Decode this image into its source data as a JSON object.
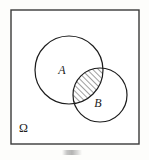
{
  "figure": {
    "kind": "venn-diagram",
    "title_caption": "",
    "background_color": "#fdfdfb",
    "stroke_color": "#1c1c1c"
  },
  "sample_space": {
    "label": "Ω",
    "name": "omega-sample-space",
    "rect": {
      "x": 11,
      "y": 10,
      "width": 128,
      "height": 134
    },
    "label_position": {
      "x": 19,
      "y": 132
    },
    "stroke_color": "#3a3a3a",
    "stroke_width": 1.4
  },
  "sets": [
    {
      "id": "A",
      "label": "A",
      "cx": 69,
      "cy": 70,
      "r": 34,
      "label_position": {
        "x": 62,
        "y": 74
      },
      "stroke_color": "#1c1c1c",
      "stroke_width": 1.2
    },
    {
      "id": "B",
      "label": "B",
      "cx": 100,
      "cy": 95,
      "r": 27,
      "label_position": {
        "x": 98,
        "y": 107
      },
      "stroke_color": "#1c1c1c",
      "stroke_width": 1.2
    }
  ],
  "intersection": {
    "name": "a-intersect-b",
    "shaded": true,
    "hatch_angle_deg": 45,
    "hatch_spacing_px": 4,
    "hatch_color": "#1c1c1c",
    "description": "A ∩ B"
  },
  "caption": {
    "text": "",
    "visible_as": "faint-smudge"
  }
}
